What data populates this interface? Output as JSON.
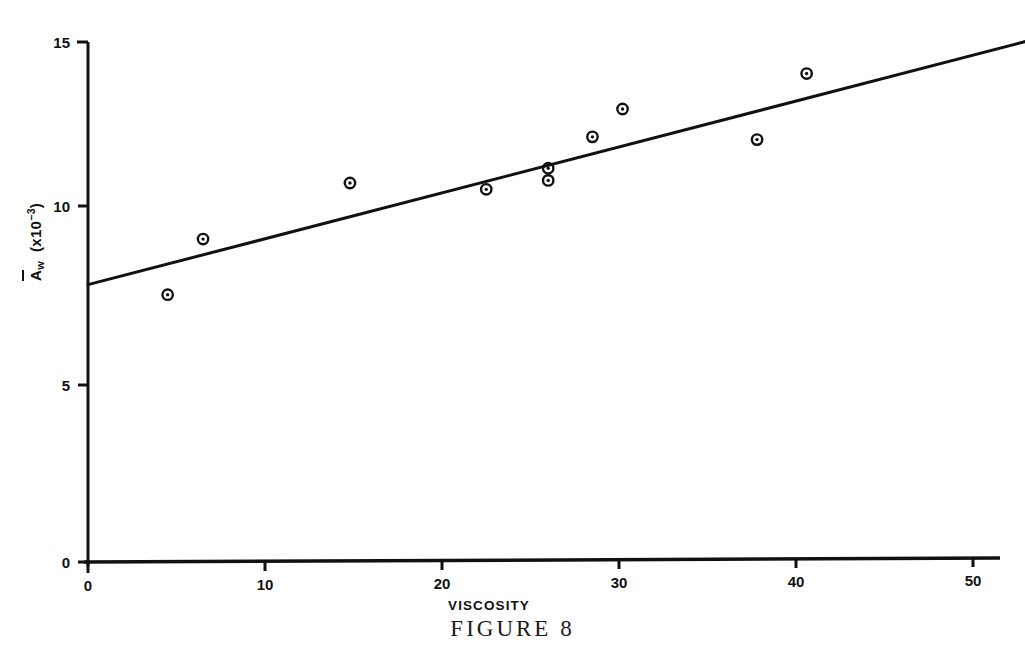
{
  "caption": "FIGURE 8",
  "chart_data": {
    "type": "scatter",
    "title": "",
    "subtitle": "",
    "xlabel": "VISCOSITY",
    "ylabel": "Aw (x10-3)",
    "ylabel_parts": {
      "symbol": "A",
      "subscript": "w",
      "units_open": "(x10",
      "exponent": "-3",
      "units_close": ")"
    },
    "xlim": [
      0,
      53
    ],
    "ylim": [
      0,
      15
    ],
    "xticks": [
      0,
      10,
      20,
      30,
      40,
      50
    ],
    "xtick_labels": [
      "0",
      "10",
      "20",
      "30",
      "40",
      "50"
    ],
    "yticks": [
      0,
      5,
      10,
      15
    ],
    "ytick_labels": [
      "0",
      "5",
      "10",
      "15"
    ],
    "grid": false,
    "legend": null,
    "marker": "circle-with-dot",
    "points": [
      {
        "x": 4.5,
        "y": 7.7
      },
      {
        "x": 6.5,
        "y": 9.3
      },
      {
        "x": 14.8,
        "y": 10.9
      },
      {
        "x": 22.5,
        "y": 10.7
      },
      {
        "x": 26.0,
        "y": 11.3
      },
      {
        "x": 26.0,
        "y": 10.95
      },
      {
        "x": 28.5,
        "y": 12.2
      },
      {
        "x": 30.2,
        "y": 13.0
      },
      {
        "x": 37.8,
        "y": 12.1
      },
      {
        "x": 40.6,
        "y": 14.0
      }
    ],
    "fit_line": {
      "type": "line",
      "x": [
        0,
        53
      ],
      "y": [
        8.0,
        14.9
      ]
    }
  },
  "axes": {
    "x_axis_name": "x-axis",
    "y_axis_name": "y-axis"
  }
}
